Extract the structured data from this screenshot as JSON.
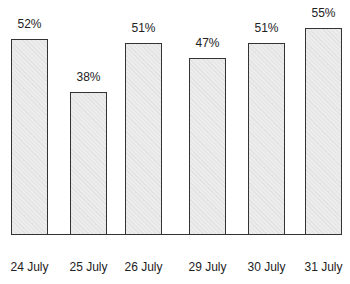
{
  "chart_data": {
    "type": "bar",
    "title": "",
    "xlabel": "",
    "ylabel": "",
    "categories": [
      "24 July",
      "25 July",
      "26 July",
      "29 July",
      "30 July",
      "31 July"
    ],
    "values": [
      52,
      38,
      51,
      47,
      51,
      55
    ],
    "value_labels": [
      "52%",
      "38%",
      "51%",
      "47%",
      "51%",
      "55%"
    ],
    "unit": "%",
    "ylim": [
      0,
      70
    ],
    "grid": false,
    "legend": null
  }
}
